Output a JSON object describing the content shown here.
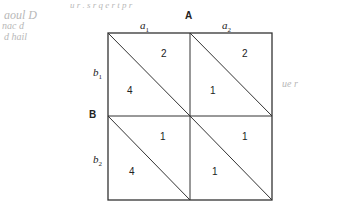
{
  "diagram": {
    "type": "payoff-matrix",
    "players": {
      "column": "A",
      "row": "B"
    },
    "column_strategies": [
      {
        "base": "a",
        "sub": "1"
      },
      {
        "base": "a",
        "sub": "2"
      }
    ],
    "row_strategies": [
      {
        "base": "b",
        "sub": "1"
      },
      {
        "base": "b",
        "sub": "2"
      }
    ],
    "cells": [
      {
        "row": "b1",
        "col": "a1",
        "upper_right": "2",
        "lower_left": "4"
      },
      {
        "row": "b1",
        "col": "a2",
        "upper_right": "2",
        "lower_left": "1"
      },
      {
        "row": "b2",
        "col": "a1",
        "upper_right": "1",
        "lower_left": "4"
      },
      {
        "row": "b2",
        "col": "a2",
        "upper_right": "1",
        "lower_left": "1"
      }
    ]
  },
  "margin_notes": {
    "top_left": [
      "aoul  D",
      "nac  d",
      "d  hail"
    ],
    "top_scribble": "u     r    .    s  r  q       e  r       t  p  r",
    "right": [
      "ue  r"
    ]
  }
}
